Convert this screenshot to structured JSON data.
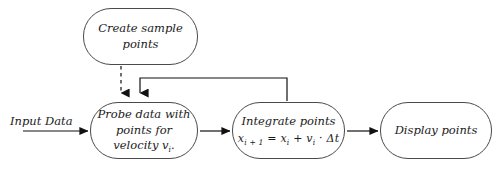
{
  "diagram": {
    "background_color": "#ffffff",
    "stroke_color": "#4a4a4a",
    "text_color": "#1b1b1b",
    "nodes": [
      {
        "id": "create-sample-points",
        "lines": [
          "Create sample",
          "points"
        ],
        "shape": "rounded-rectangle"
      },
      {
        "id": "probe-data",
        "lines": [
          "Probe data with",
          "points for",
          "velocity"
        ],
        "velocity_symbol": "v",
        "velocity_subscript": "i",
        "velocity_trailing": ".",
        "shape": "rounded-rectangle"
      },
      {
        "id": "integrate-points",
        "lines": [
          "Integrate points"
        ],
        "formula": {
          "lhs_var": "x",
          "lhs_sub": "i + 1",
          "equals": "=",
          "term1_var": "x",
          "term1_sub": "i",
          "plus": "+",
          "term2_var": "v",
          "term2_sub": "i",
          "dot": "·",
          "term3": "Δt"
        },
        "shape": "rounded-rectangle"
      },
      {
        "id": "display-points",
        "lines": [
          "Display points"
        ],
        "shape": "rounded-rectangle"
      }
    ],
    "edge_labels": {
      "input_data": "Input Data"
    },
    "connectors": [
      {
        "id": "input-to-probe",
        "style": "solid",
        "direction": "right"
      },
      {
        "id": "create-to-probe",
        "style": "dashed",
        "direction": "down"
      },
      {
        "id": "probe-to-integrate",
        "style": "solid",
        "direction": "right"
      },
      {
        "id": "integrate-to-display",
        "style": "solid",
        "direction": "right"
      },
      {
        "id": "integrate-feedback-to-probe",
        "style": "solid",
        "direction": "loop-down"
      }
    ]
  }
}
